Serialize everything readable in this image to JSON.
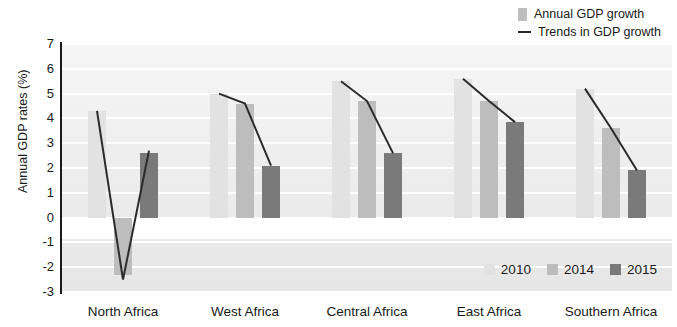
{
  "chart_data": {
    "type": "bar",
    "title": "",
    "xlabel": "",
    "ylabel": "Annual GDP rates (%)",
    "ylim": [
      -3,
      7
    ],
    "ytick_labels": [
      "7",
      "6",
      "5",
      "4",
      "3",
      "2",
      "1",
      "0",
      "-1",
      "-2",
      "-3"
    ],
    "ytick_values": [
      7,
      6,
      5,
      4,
      3,
      2,
      1,
      0,
      -1,
      -2,
      -3
    ],
    "grid": true,
    "legend_position": "top-right and bottom-right",
    "categories": [
      "North Africa",
      "West Africa",
      "Central Africa",
      "East Africa",
      "Southern Africa"
    ],
    "series": [
      {
        "name": "2010",
        "color": "#e2e2e2",
        "values": [
          4.3,
          5.0,
          5.5,
          5.6,
          5.2
        ]
      },
      {
        "name": "2014",
        "color": "#bdbdbd",
        "values": [
          -2.3,
          4.6,
          4.7,
          4.7,
          3.6
        ]
      },
      {
        "name": "2015",
        "color": "#7a7a7a",
        "values": [
          2.6,
          2.1,
          2.6,
          3.85,
          1.9
        ]
      }
    ],
    "trend_lines": [
      {
        "category": "North Africa",
        "values": [
          4.3,
          -2.5,
          2.7
        ]
      },
      {
        "category": "West Africa",
        "values": [
          5.0,
          4.6,
          2.1
        ]
      },
      {
        "category": "Central Africa",
        "values": [
          5.5,
          4.7,
          2.6
        ]
      },
      {
        "category": "East Africa",
        "values": [
          5.6,
          4.7,
          3.85
        ]
      },
      {
        "category": "Southern Africa",
        "values": [
          5.2,
          3.6,
          1.9
        ]
      }
    ],
    "trend_color": "#2b2b2b"
  },
  "legend_top": {
    "items": [
      {
        "label": "Annual GDP growth",
        "marker": "box",
        "color": "#bdbdbd"
      },
      {
        "label": "Trends in GDP growth",
        "marker": "line",
        "color": "#2b2b2b"
      }
    ]
  },
  "legend_bottom": {
    "items": [
      {
        "label": "2010",
        "color": "#e2e2e2"
      },
      {
        "label": "2014",
        "color": "#bdbdbd"
      },
      {
        "label": "2015",
        "color": "#7a7a7a"
      }
    ]
  }
}
